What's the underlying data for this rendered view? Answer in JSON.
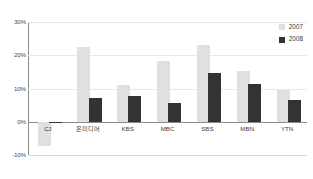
{
  "chart_data": {
    "type": "bar",
    "title": "",
    "xlabel": "",
    "ylabel": "",
    "categories": [
      "CJ",
      "온미디어",
      "KBS",
      "MBC",
      "SBS",
      "MBN",
      "YTN"
    ],
    "series": [
      {
        "name": "2007",
        "color": "#e0e0e0",
        "values": [
          -7.2,
          22.5,
          11.0,
          18.3,
          23.0,
          15.2,
          9.7
        ]
      },
      {
        "name": "2008",
        "color": "#333333",
        "values": [
          -0.4,
          7.2,
          7.8,
          5.8,
          14.8,
          11.3,
          6.5
        ]
      }
    ],
    "ylim": [
      -10,
      30
    ],
    "yticks": [
      30,
      20,
      10,
      0,
      -10
    ],
    "ytick_labels": [
      "30%",
      "20%",
      "10%",
      "0%",
      "-10%"
    ],
    "grid": true,
    "legend_position": "top-right",
    "legend": [
      "2007",
      "2008"
    ]
  },
  "legend": {
    "items": [
      {
        "label": "2007"
      },
      {
        "label": "2008"
      }
    ]
  },
  "axis": {
    "y_labels": [
      "30%",
      "20%",
      "10%",
      "0%",
      "-10%"
    ]
  }
}
